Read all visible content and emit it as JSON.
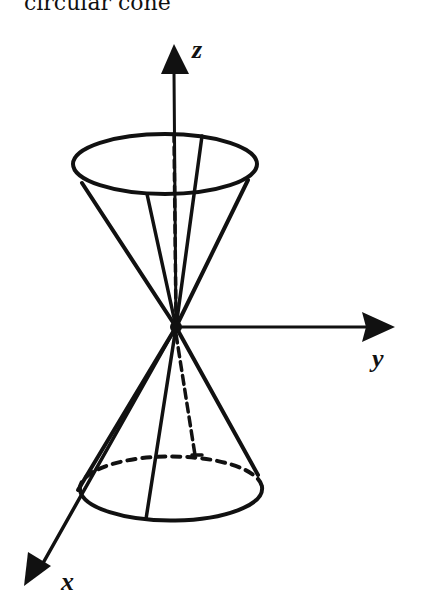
{
  "caption": "circular cone",
  "axes": {
    "z": {
      "label": "z"
    },
    "y": {
      "label": "y"
    },
    "x": {
      "label": "x"
    }
  },
  "figure": {
    "stroke_color": "#111111",
    "background": "#ffffff"
  }
}
